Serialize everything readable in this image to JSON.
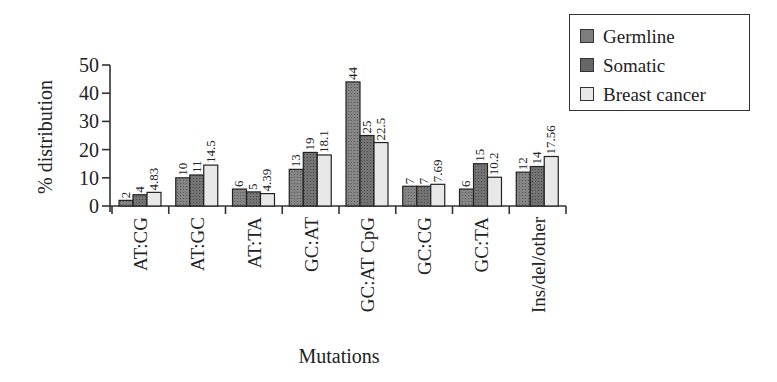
{
  "chart_data": {
    "type": "bar",
    "title": "",
    "xlabel": "Mutations",
    "ylabel": "% distribution",
    "ylim": [
      0,
      50
    ],
    "yticks": [
      0,
      10,
      20,
      30,
      40,
      50
    ],
    "grid": false,
    "legend_position": "top-right",
    "categories": [
      "AT:CG",
      "AT:GC",
      "AT:TA",
      "GC:AT",
      "GC:AT CpG",
      "GC:CG",
      "GC:TA",
      "Ins/del/other"
    ],
    "series": [
      {
        "name": "Germline",
        "color": "#7a7a7a",
        "values": [
          2,
          10,
          6,
          13,
          44,
          7,
          6,
          12
        ],
        "labels": [
          "2",
          "10",
          "6",
          "13",
          "44",
          "7",
          "6",
          "12"
        ]
      },
      {
        "name": "Somatic",
        "color": "#6a6a6a",
        "values": [
          4,
          11,
          5,
          19,
          25,
          7,
          15,
          14
        ],
        "labels": [
          "4",
          "11",
          "5",
          "19",
          "25",
          "7",
          "15",
          "14"
        ]
      },
      {
        "name": "Breast cancer",
        "color": "#e6e6e6",
        "values": [
          4.83,
          14.5,
          4.39,
          18.1,
          22.5,
          7.69,
          10.2,
          17.56
        ],
        "labels": [
          "4.83",
          "14.5",
          "4.39",
          "18.1",
          "22.5",
          "7.69",
          "10.2",
          "17.56"
        ]
      }
    ]
  },
  "legend": {
    "items": [
      {
        "label": "Germline",
        "color": "#7a7a7a"
      },
      {
        "label": "Somatic",
        "color": "#6a6a6a"
      },
      {
        "label": "Breast cancer",
        "color": "#e6e6e6"
      }
    ]
  }
}
